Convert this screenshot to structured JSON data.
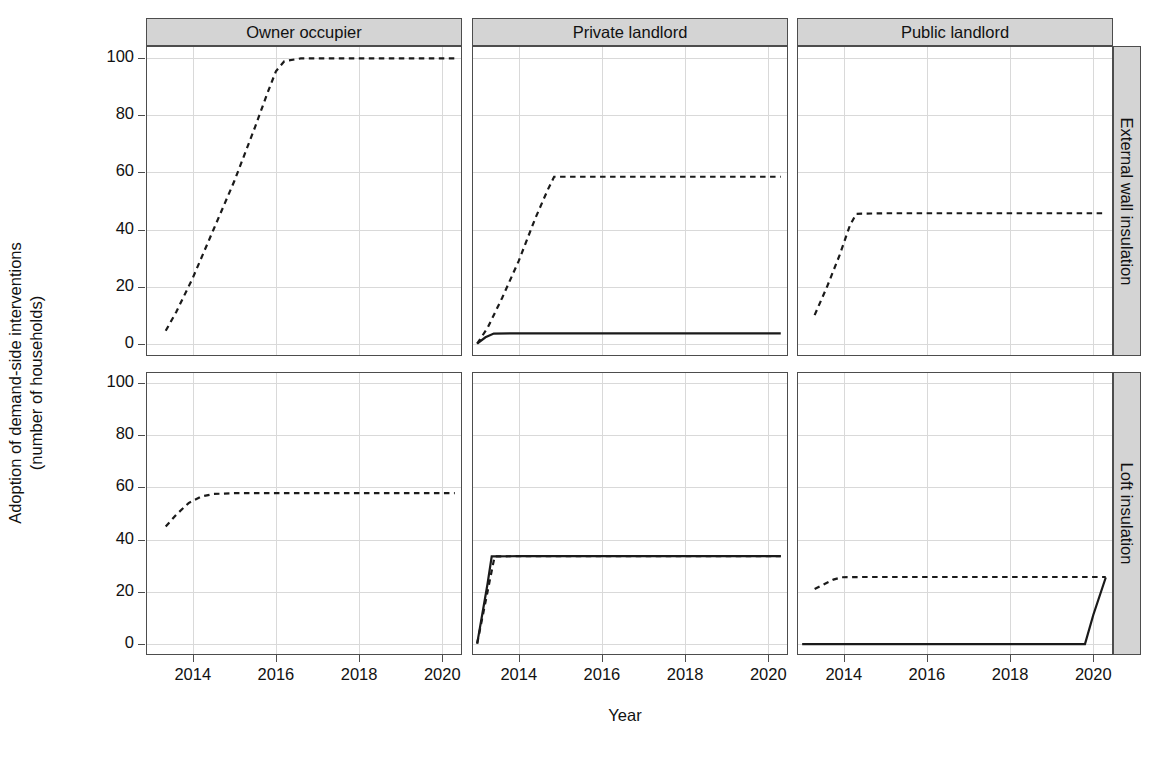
{
  "chart_data": {
    "type": "line",
    "title": "",
    "xlabel": "Year",
    "ylabel": "Adoption of demand-side interventions\n(number of households)",
    "ylabel_line1": "Adoption of demand-side interventions",
    "ylabel_line2": "(number of households)",
    "xlim": [
      2012.9,
      2020.45
    ],
    "ylim": [
      -4,
      104
    ],
    "xticks": [
      2014,
      2016,
      2018,
      2020
    ],
    "xtick_labels": [
      "2014",
      "2016",
      "2018",
      "2020"
    ],
    "yticks": [
      0,
      20,
      40,
      60,
      80,
      100
    ],
    "ytick_labels": [
      "0",
      "20",
      "40",
      "60",
      "80",
      "100"
    ],
    "grid": true,
    "legend": "none",
    "facet_cols": [
      "Owner occupier",
      "Private landlord",
      "Public landlord"
    ],
    "facet_rows": [
      "External wall insulation",
      "Loft insulation"
    ],
    "line_styles": {
      "solid": "solid",
      "dashed": "dashed"
    },
    "colors": {
      "line": "#1a1a1a",
      "grid": "#d9d9d9",
      "strip_fill": "#d4d4d4",
      "panel_border": "#4d4d4d",
      "background": "#ffffff"
    },
    "panels": [
      {
        "row": "External wall insulation",
        "col": "Owner occupier",
        "series": [
          {
            "name": "dashed",
            "style": "dashed",
            "x": [
              2013.35,
              2013.6,
              2014.0,
              2014.5,
              2015.0,
              2015.5,
              2015.8,
              2016.0,
              2016.2,
              2016.6,
              2017.5,
              2018.5,
              2019.5,
              2020.3
            ],
            "y": [
              4.5,
              11.0,
              23.0,
              40.0,
              57.0,
              76.0,
              88.0,
              95.5,
              99.0,
              100.0,
              100.0,
              100.0,
              100.0,
              100.0
            ]
          }
        ]
      },
      {
        "row": "External wall insulation",
        "col": "Private landlord",
        "series": [
          {
            "name": "dashed",
            "style": "dashed",
            "x": [
              2013.0,
              2013.25,
              2013.6,
              2014.0,
              2014.4,
              2014.7,
              2014.85,
              2015.5,
              2016.5,
              2018.0,
              2020.3
            ],
            "y": [
              0.0,
              5.5,
              16.0,
              29.0,
              44.0,
              54.0,
              58.5,
              58.5,
              58.5,
              58.5,
              58.5
            ]
          },
          {
            "name": "solid",
            "style": "solid",
            "x": [
              2013.0,
              2013.2,
              2013.4,
              2014.0,
              2016.0,
              2018.0,
              2020.3
            ],
            "y": [
              0.0,
              2.2,
              3.5,
              3.6,
              3.6,
              3.6,
              3.6
            ]
          }
        ]
      },
      {
        "row": "External wall insulation",
        "col": "Public landlord",
        "series": [
          {
            "name": "dashed",
            "style": "dashed",
            "x": [
              2013.3,
              2013.6,
              2013.9,
              2014.15,
              2014.3,
              2015.0,
              2016.5,
              2018.0,
              2020.3
            ],
            "y": [
              10.0,
              20.0,
              31.0,
              41.5,
              45.5,
              45.7,
              45.7,
              45.7,
              45.7
            ]
          }
        ]
      },
      {
        "row": "Loft insulation",
        "col": "Owner occupier",
        "series": [
          {
            "name": "dashed",
            "style": "dashed",
            "x": [
              2013.35,
              2013.6,
              2013.9,
              2014.2,
              2014.5,
              2015.0,
              2016.5,
              2018.0,
              2020.3
            ],
            "y": [
              45.0,
              49.5,
              54.0,
              56.5,
              57.5,
              57.8,
              57.8,
              57.8,
              57.8
            ]
          }
        ]
      },
      {
        "row": "Loft insulation",
        "col": "Private landlord",
        "series": [
          {
            "name": "dashed",
            "style": "dashed",
            "x": [
              2013.0,
              2013.1,
              2013.2,
              2013.3,
              2013.42,
              2014.0,
              2016.0,
              2018.0,
              2020.3
            ],
            "y": [
              0.0,
              8.0,
              16.0,
              24.0,
              33.5,
              33.6,
              33.6,
              33.6,
              33.6
            ]
          },
          {
            "name": "solid",
            "style": "solid",
            "x": [
              2013.0,
              2013.12,
              2013.25,
              2013.35,
              2014.0,
              2016.0,
              2018.0,
              2020.3
            ],
            "y": [
              0.0,
              11.0,
              23.0,
              33.5,
              33.6,
              33.6,
              33.6,
              33.6
            ]
          }
        ]
      },
      {
        "row": "Loft insulation",
        "col": "Public landlord",
        "series": [
          {
            "name": "dashed",
            "style": "dashed",
            "x": [
              2013.3,
              2013.55,
              2013.75,
              2013.95,
              2014.5,
              2016.0,
              2018.0,
              2020.3
            ],
            "y": [
              21.0,
              23.0,
              24.6,
              25.5,
              25.6,
              25.6,
              25.6,
              25.6
            ]
          },
          {
            "name": "solid",
            "style": "solid",
            "x": [
              2013.0,
              2015.0,
              2017.0,
              2019.0,
              2019.8,
              2020.0,
              2020.3
            ],
            "y": [
              -0.2,
              -0.2,
              -0.2,
              -0.2,
              -0.2,
              11.0,
              25.4
            ]
          }
        ]
      }
    ]
  },
  "layout": {
    "panel_left": [
      146,
      472,
      797
    ],
    "panel_width": [
      316,
      316,
      316
    ],
    "panel_top": [
      46,
      372
    ],
    "panel_height": [
      310,
      283
    ],
    "strip_top_height": 28,
    "strip_right_width": 28
  }
}
